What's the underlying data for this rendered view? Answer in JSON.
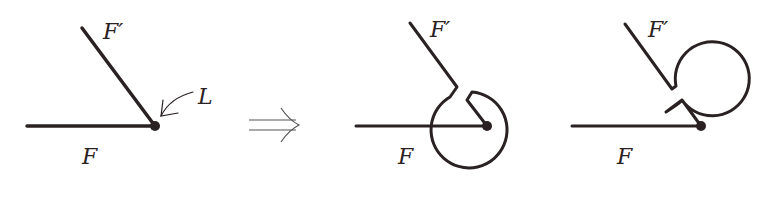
{
  "colors": {
    "stroke": "#2a2222",
    "background": "#ffffff"
  },
  "panel1": {
    "label_f": "F",
    "label_fprime": "F′",
    "label_l": "L"
  },
  "arrow": {
    "glyph": "⟹",
    "meaning": "implies"
  },
  "panel2": {
    "label_f": "F",
    "label_fprime": "F′"
  },
  "panel3": {
    "label_f": "F",
    "label_fprime": "F′"
  }
}
